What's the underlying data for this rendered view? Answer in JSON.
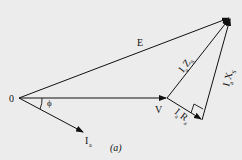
{
  "diagram": {
    "caption": "(a)",
    "labels": {
      "origin": "0",
      "E": "E",
      "V": "V",
      "phi": "ϕ",
      "Ia": "I",
      "Ia_sub": "a",
      "IaZs": "I",
      "IaZs_sub1": "a",
      "IaZs_main": "Z",
      "IaZs_sub2": "S",
      "IaXs": "I",
      "IaXs_sub1": "a",
      "IaXs_main": "X",
      "IaXs_sub2": "S",
      "IaRa": "I",
      "IaRa_sub1": "a",
      "IaRa_main": "R",
      "IaRa_sub2": "a"
    },
    "points": {
      "origin": [
        19,
        98
      ],
      "V_tip": [
        167,
        98
      ],
      "E_tip": [
        230,
        17
      ],
      "Ia_tip": [
        84,
        132
      ],
      "IaRa_tip": [
        202,
        120
      ]
    },
    "colors": {
      "line": "#111111",
      "background": "#ececec"
    }
  }
}
